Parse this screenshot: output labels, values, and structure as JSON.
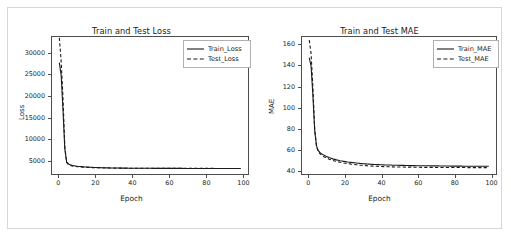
{
  "figure": {
    "background": "#ffffff",
    "border_color": "#d7d7d7",
    "line_color": "#1a1a1a"
  },
  "chart_data": [
    {
      "type": "line",
      "title": "Train and Test Loss",
      "xlabel": "Epoch",
      "ylabel": "Loss",
      "xlim": [
        -4,
        103
      ],
      "ylim": [
        1800,
        33800
      ],
      "xticks": [
        0,
        20,
        40,
        60,
        80,
        100
      ],
      "yticks": [
        5000,
        10000,
        15000,
        20000,
        25000,
        30000
      ],
      "xticklabels": [
        "0",
        "20",
        "40",
        "60",
        "80",
        "100"
      ],
      "yticklabels": [
        "5000",
        "10000",
        "15000",
        "20000",
        "25000",
        "30000"
      ],
      "grid": false,
      "legend_position": "upper right",
      "series": [
        {
          "name": "Train_Loss",
          "style": "solid",
          "color": "#1a1a1a",
          "x": [
            0,
            1,
            2,
            3,
            4,
            5,
            6,
            7,
            8,
            9,
            10,
            11,
            12,
            13,
            14,
            15,
            16,
            17,
            18,
            19,
            20,
            21,
            22,
            23,
            24,
            25,
            26,
            27,
            28,
            29,
            30,
            31,
            32,
            33,
            34,
            35,
            36,
            37,
            38,
            39,
            40,
            41,
            42,
            43,
            44,
            45,
            46,
            47,
            48,
            49,
            50,
            51,
            52,
            53,
            54,
            55,
            56,
            57,
            58,
            59,
            60,
            61,
            62,
            63,
            64,
            65,
            66,
            67,
            68,
            69,
            70,
            71,
            72,
            73,
            74,
            75,
            76,
            77,
            78,
            79,
            80,
            81,
            82,
            83,
            84,
            85,
            86,
            87,
            88,
            89,
            90,
            91,
            92,
            93,
            94,
            95,
            96,
            97,
            98,
            99
          ],
          "values": [
            27800,
            24900,
            16800,
            7600,
            4600,
            4150,
            3950,
            3820,
            3740,
            3660,
            3600,
            3560,
            3520,
            3480,
            3450,
            3420,
            3395,
            3370,
            3350,
            3330,
            3312,
            3296,
            3282,
            3268,
            3255,
            3244,
            3234,
            3224,
            3216,
            3208,
            3200,
            3194,
            3188,
            3182,
            3178,
            3172,
            3168,
            3164,
            3160,
            3156,
            3152,
            3150,
            3146,
            3143,
            3140,
            3138,
            3135,
            3132,
            3130,
            3128,
            3126,
            3124,
            3122,
            3120,
            3118,
            3117,
            3115,
            3114,
            3112,
            3111,
            3110,
            3108,
            3107,
            3106,
            3105,
            3104,
            3103,
            3102,
            3101,
            3100,
            3099,
            3098,
            3098,
            3097,
            3096,
            3095,
            3095,
            3094,
            3093,
            3093,
            3092,
            3092,
            3091,
            3091,
            3090,
            3090,
            3089,
            3089,
            3088,
            3088,
            3088,
            3087,
            3087,
            3087,
            3086,
            3086,
            3086,
            3085,
            3085,
            3085
          ]
        },
        {
          "name": "Test_Loss",
          "style": "dashed",
          "color": "#1a1a1a",
          "x": [
            0,
            1,
            2,
            3,
            4,
            5,
            6,
            7,
            8,
            9,
            10,
            11,
            12,
            13,
            14,
            15,
            16,
            17,
            18,
            19,
            20,
            21,
            22,
            23,
            24,
            25,
            26,
            27,
            28,
            29,
            30,
            31,
            32,
            33,
            34,
            35,
            36,
            37,
            38,
            39,
            40,
            41,
            42,
            43,
            44,
            45,
            46,
            47,
            48,
            49,
            50,
            51,
            52,
            53,
            54,
            55,
            56,
            57,
            58,
            59,
            60,
            61,
            62,
            63,
            64,
            65,
            66,
            67,
            68,
            69,
            70,
            71,
            72,
            73,
            74,
            75,
            76,
            77,
            78,
            79,
            80,
            81,
            82,
            83,
            84,
            85,
            86,
            87,
            88,
            89,
            90,
            91,
            92,
            93,
            94,
            95,
            96,
            97,
            98,
            99
          ],
          "values": [
            33600,
            28200,
            19500,
            8200,
            4500,
            3980,
            3800,
            3700,
            3620,
            3560,
            3510,
            3470,
            3435,
            3405,
            3380,
            3355,
            3335,
            3315,
            3298,
            3282,
            3268,
            3255,
            3244,
            3234,
            3224,
            3216,
            3208,
            3200,
            3194,
            3188,
            3183,
            3178,
            3173,
            3169,
            3165,
            3161,
            3158,
            3155,
            3152,
            3149,
            3147,
            3144,
            3142,
            3140,
            3138,
            3136,
            3134,
            3132,
            3131,
            3129,
            3128,
            3126,
            3125,
            3124,
            3122,
            3121,
            3120,
            3119,
            3118,
            3117,
            3116,
            3115,
            3114,
            3113,
            3113,
            3112,
            3111,
            3110,
            3110,
            3109,
            3108,
            3108,
            3107,
            3107,
            3106,
            3106,
            3105,
            3105,
            3104,
            3104,
            3103,
            3103,
            3103,
            3102,
            3102,
            3101,
            3101,
            3101,
            3100,
            3100,
            3100,
            3099,
            3099,
            3099,
            3099,
            3098,
            3098,
            3098,
            3098,
            3097
          ]
        }
      ]
    },
    {
      "type": "line",
      "title": "Train and Test MAE",
      "xlabel": "Epoch",
      "ylabel": "MAE",
      "xlim": [
        -4,
        103
      ],
      "ylim": [
        36,
        168
      ],
      "xticks": [
        0,
        20,
        40,
        60,
        80,
        100
      ],
      "yticks": [
        40,
        60,
        80,
        100,
        120,
        140,
        160
      ],
      "xticklabels": [
        "0",
        "20",
        "40",
        "60",
        "80",
        "100"
      ],
      "yticklabels": [
        "40",
        "60",
        "80",
        "100",
        "120",
        "140",
        "160"
      ],
      "grid": false,
      "legend_position": "upper right",
      "series": [
        {
          "name": "Train_MAE",
          "style": "solid",
          "color": "#1a1a1a",
          "x": [
            0,
            1,
            2,
            3,
            4,
            5,
            6,
            7,
            8,
            9,
            10,
            11,
            12,
            13,
            14,
            15,
            16,
            17,
            18,
            19,
            20,
            21,
            22,
            23,
            24,
            25,
            26,
            27,
            28,
            29,
            30,
            31,
            32,
            33,
            34,
            35,
            36,
            37,
            38,
            39,
            40,
            41,
            42,
            43,
            44,
            45,
            46,
            47,
            48,
            49,
            50,
            51,
            52,
            53,
            54,
            55,
            56,
            57,
            58,
            59,
            60,
            61,
            62,
            63,
            64,
            65,
            66,
            67,
            68,
            69,
            70,
            71,
            72,
            73,
            74,
            75,
            76,
            77,
            78,
            79,
            80,
            81,
            82,
            83,
            84,
            85,
            86,
            87,
            88,
            89,
            90,
            91,
            92,
            93,
            94,
            95,
            96,
            97,
            98,
            99
          ],
          "values": [
            148,
            140,
            112,
            78,
            63,
            58.5,
            56.5,
            55.2,
            54.2,
            53.3,
            52.5,
            51.8,
            51.2,
            50.6,
            50.1,
            49.6,
            49.2,
            48.8,
            48.5,
            48.2,
            47.9,
            47.6,
            47.4,
            47.2,
            47.0,
            46.8,
            46.6,
            46.4,
            46.2,
            46.1,
            45.9,
            45.8,
            45.6,
            45.5,
            45.4,
            45.3,
            45.2,
            45.1,
            45.0,
            44.9,
            44.9,
            44.8,
            44.7,
            44.7,
            44.6,
            44.6,
            44.5,
            44.5,
            44.4,
            44.4,
            44.3,
            44.3,
            44.3,
            44.2,
            44.2,
            44.2,
            44.1,
            44.1,
            44.1,
            44.0,
            44.0,
            44.0,
            44.0,
            43.9,
            43.9,
            43.9,
            43.9,
            43.8,
            43.8,
            43.8,
            43.8,
            43.8,
            43.7,
            43.7,
            43.7,
            43.7,
            43.7,
            43.7,
            43.6,
            43.6,
            43.6,
            43.6,
            43.6,
            43.6,
            43.6,
            43.5,
            43.5,
            43.5,
            43.5,
            43.5,
            43.5,
            43.5,
            43.5,
            43.4,
            43.4,
            43.4,
            43.4,
            43.4,
            43.4,
            43.4
          ]
        },
        {
          "name": "Test_MAE",
          "style": "dashed",
          "color": "#1a1a1a",
          "x": [
            0,
            1,
            2,
            3,
            4,
            5,
            6,
            7,
            8,
            9,
            10,
            11,
            12,
            13,
            14,
            15,
            16,
            17,
            18,
            19,
            20,
            21,
            22,
            23,
            24,
            25,
            26,
            27,
            28,
            29,
            30,
            31,
            32,
            33,
            34,
            35,
            36,
            37,
            38,
            39,
            40,
            41,
            42,
            43,
            44,
            45,
            46,
            47,
            48,
            49,
            50,
            51,
            52,
            53,
            54,
            55,
            56,
            57,
            58,
            59,
            60,
            61,
            62,
            63,
            64,
            65,
            66,
            67,
            68,
            69,
            70,
            71,
            72,
            73,
            74,
            75,
            76,
            77,
            78,
            79,
            80,
            81,
            82,
            83,
            84,
            85,
            86,
            87,
            88,
            89,
            90,
            91,
            92,
            93,
            94,
            95,
            96,
            97,
            98,
            99
          ],
          "values": [
            165,
            152,
            120,
            80,
            62.5,
            57.5,
            55.3,
            53.8,
            52.7,
            51.8,
            51.0,
            50.3,
            49.7,
            49.1,
            48.6,
            48.1,
            47.7,
            47.3,
            47.0,
            46.6,
            46.3,
            46.0,
            45.8,
            45.5,
            45.3,
            45.1,
            44.9,
            44.7,
            44.5,
            44.4,
            44.2,
            44.1,
            43.9,
            43.8,
            43.7,
            43.6,
            43.5,
            43.4,
            43.3,
            43.3,
            43.2,
            43.1,
            43.1,
            43.0,
            43.0,
            42.9,
            42.9,
            42.8,
            42.8,
            42.8,
            42.7,
            42.7,
            42.7,
            42.6,
            42.6,
            42.6,
            42.6,
            42.5,
            42.5,
            42.5,
            42.5,
            42.5,
            42.4,
            42.4,
            42.4,
            42.4,
            42.4,
            42.4,
            42.3,
            42.3,
            42.3,
            42.3,
            42.3,
            42.3,
            42.3,
            42.3,
            42.2,
            42.2,
            42.2,
            42.2,
            42.2,
            42.2,
            42.2,
            42.2,
            42.2,
            42.2,
            42.2,
            42.1,
            42.1,
            42.1,
            42.1,
            42.1,
            42.1,
            42.1,
            42.1,
            42.1,
            42.1,
            42.1,
            42.1,
            42.1
          ]
        }
      ]
    }
  ]
}
